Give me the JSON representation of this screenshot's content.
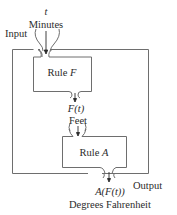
{
  "diagram": {
    "input_label": "Input",
    "input_variable": "t",
    "input_unit": "Minutes",
    "rule_f_label_prefix": "Rule ",
    "rule_f_name": "F",
    "intermediate_variable": "F(t)",
    "intermediate_unit": "Feet",
    "rule_a_label_prefix": "Rule ",
    "rule_a_name": "A",
    "output_variable": "A(F(t))",
    "output_unit": "Degrees Fahrenheit",
    "output_label": "Output",
    "line_color": "#6e6e6e"
  }
}
